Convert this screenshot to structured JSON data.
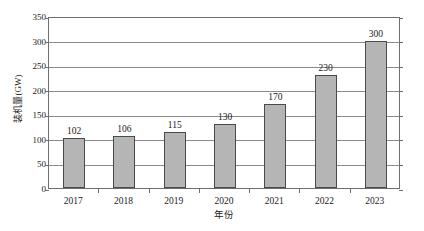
{
  "chart_data": {
    "type": "bar",
    "title": "",
    "subtitle": "",
    "xlabel": "年份",
    "ylabel": "装机量(GW)",
    "categories": [
      "2017",
      "2018",
      "2019",
      "2020",
      "2021",
      "2022",
      "2023"
    ],
    "values": [
      102,
      106,
      115,
      130,
      170,
      230,
      300
    ],
    "data_labels": [
      "102",
      "106",
      "115",
      "130",
      "170",
      "230",
      "300"
    ],
    "ylim": [
      0,
      350
    ],
    "ytick_step": 50,
    "ytick_labels": [
      "0",
      "50",
      "100",
      "150",
      "200",
      "250",
      "300",
      "350"
    ],
    "ytick_values": [
      0,
      50,
      100,
      150,
      200,
      250,
      300,
      350
    ],
    "grid": true,
    "grid_axis": "y",
    "legend": false,
    "legend_position": "none",
    "series": [
      {
        "name": "装机量(GW)",
        "values": [
          102,
          106,
          115,
          130,
          170,
          230,
          300
        ]
      }
    ],
    "colors": {
      "bar_fill": "#b5b5b5",
      "bar_border": "#4a4a4a",
      "gridline": "#8a8a8a",
      "axis": "#6e6e6e",
      "text": "#1a1a1a",
      "background": "#ffffff"
    }
  }
}
